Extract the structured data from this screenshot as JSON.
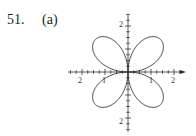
{
  "problem": {
    "number": "51.",
    "part": "(a)"
  },
  "chart_data": {
    "type": "line",
    "title": "",
    "xlabel": "",
    "ylabel": "",
    "x_tick_labels": [
      "2",
      "1",
      "1",
      "2"
    ],
    "y_tick_labels": [
      "2",
      "2"
    ],
    "xlim": [
      -2.5,
      2.5
    ],
    "ylim": [
      -2.5,
      2.5
    ],
    "grid": false,
    "legend": "none",
    "series": [
      {
        "name": "rose",
        "equation": "r = 2 sin 2θ",
        "petals": 4,
        "max_r": 2
      }
    ]
  },
  "axis_labels": {
    "x_neg2": "2",
    "x_neg1": "1",
    "x_pos1": "1",
    "x_pos2": "2",
    "y_pos2": "2",
    "y_neg2": "2"
  }
}
